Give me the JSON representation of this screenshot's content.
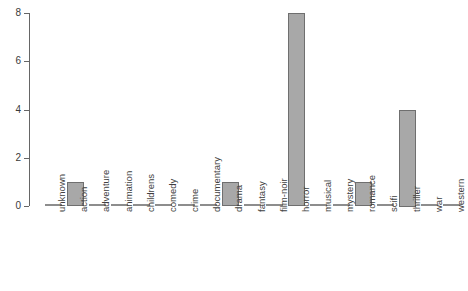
{
  "chart_data": {
    "type": "bar",
    "title": "",
    "subtitle": "",
    "xlabel": "",
    "ylabel": "",
    "categories": [
      "unknown",
      "action",
      "adventure",
      "animation",
      "childrens",
      "comedy",
      "crime",
      "documentary",
      "drama",
      "fantasy",
      "film-noir",
      "horror",
      "musical",
      "mystery",
      "romance",
      "scifi",
      "thriller",
      "war",
      "western"
    ],
    "values": [
      0,
      1,
      0,
      0,
      0,
      0,
      0,
      0,
      1,
      0,
      0,
      8,
      0,
      0,
      1,
      0,
      4,
      0,
      0
    ],
    "ylim": [
      0,
      8
    ],
    "yticks": [
      "0",
      "2",
      "4",
      "6",
      "8"
    ],
    "ytick_values": [
      0,
      2,
      4,
      6,
      8
    ],
    "grid": false,
    "legend": null,
    "bar_color": "#a8a8a8",
    "bar_border_color": "#6f6f6f",
    "axis_color": "#666666",
    "background_color": "#ffffff",
    "annotations": []
  }
}
